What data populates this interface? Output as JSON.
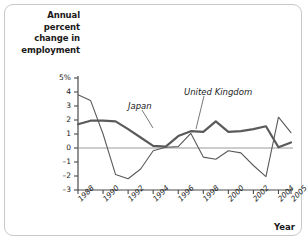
{
  "figure": {
    "background_color": "#ffffff",
    "frame_color": "#c9c9c9"
  },
  "axis_titles": {
    "y": "Annual percent change in employment",
    "y_lines": [
      "Annual",
      "percent",
      "change in",
      "employment"
    ],
    "x": "Year"
  },
  "y_ticks": [
    {
      "label": "5%",
      "value": 5
    },
    {
      "label": "4",
      "value": 4
    },
    {
      "label": "3",
      "value": 3
    },
    {
      "label": "2",
      "value": 2
    },
    {
      "label": "1",
      "value": 1
    },
    {
      "label": "0",
      "value": 0
    },
    {
      "label": "–1",
      "value": -1
    },
    {
      "label": "–2",
      "value": -2
    },
    {
      "label": "–3",
      "value": -3
    }
  ],
  "x_ticks": [
    {
      "label": "1988",
      "value": 1988
    },
    {
      "label": "1990",
      "value": 1990
    },
    {
      "label": "1992",
      "value": 1992
    },
    {
      "label": "1994",
      "value": 1994
    },
    {
      "label": "1996",
      "value": 1996
    },
    {
      "label": "1998",
      "value": 1998
    },
    {
      "label": "2000",
      "value": 2000
    },
    {
      "label": "2002",
      "value": 2002
    },
    {
      "label": "2004",
      "value": 2004
    },
    {
      "label": "2005",
      "value": 2005
    }
  ],
  "annotations": [
    {
      "name": "japan-label",
      "text": "Japan",
      "x_px": 128,
      "y_px": 101,
      "leader": {
        "x1": 142,
        "y1": 110,
        "x2": 153,
        "y2": 128
      }
    },
    {
      "name": "united-kingdom-label",
      "text": "United Kingdom",
      "x_px": 184,
      "y_px": 87,
      "leader": {
        "x1": 204,
        "y1": 96,
        "x2": 196,
        "y2": 129
      }
    }
  ],
  "chart_data": {
    "type": "line",
    "title": "",
    "xlabel": "Year",
    "ylabel": "Annual percent change in employment",
    "xlim": [
      1988,
      2005
    ],
    "ylim": [
      -3,
      5
    ],
    "grid": false,
    "zero_line": true,
    "legend_position": "inline-annotations",
    "x": [
      1988,
      1989,
      1990,
      1991,
      1992,
      1993,
      1994,
      1995,
      1996,
      1997,
      1998,
      1999,
      2000,
      2001,
      2002,
      2003,
      2004,
      2005
    ],
    "series": [
      {
        "name": "Japan",
        "color": "#5a5a5a",
        "line_width": 1.1,
        "values": [
          3.8,
          3.4,
          1.0,
          -1.9,
          -2.2,
          -1.5,
          -0.2,
          0.05,
          0.1,
          1.05,
          -0.65,
          -0.8,
          -0.2,
          -0.35,
          -1.25,
          -2.05,
          2.2,
          1.1
        ]
      },
      {
        "name": "United Kingdom",
        "color": "#5a5a5a",
        "line_width": 2.2,
        "values": [
          1.7,
          1.95,
          1.95,
          1.9,
          1.35,
          0.75,
          0.15,
          0.1,
          0.85,
          1.2,
          1.15,
          1.9,
          1.15,
          1.2,
          1.35,
          1.55,
          0.05,
          0.4
        ]
      }
    ]
  }
}
